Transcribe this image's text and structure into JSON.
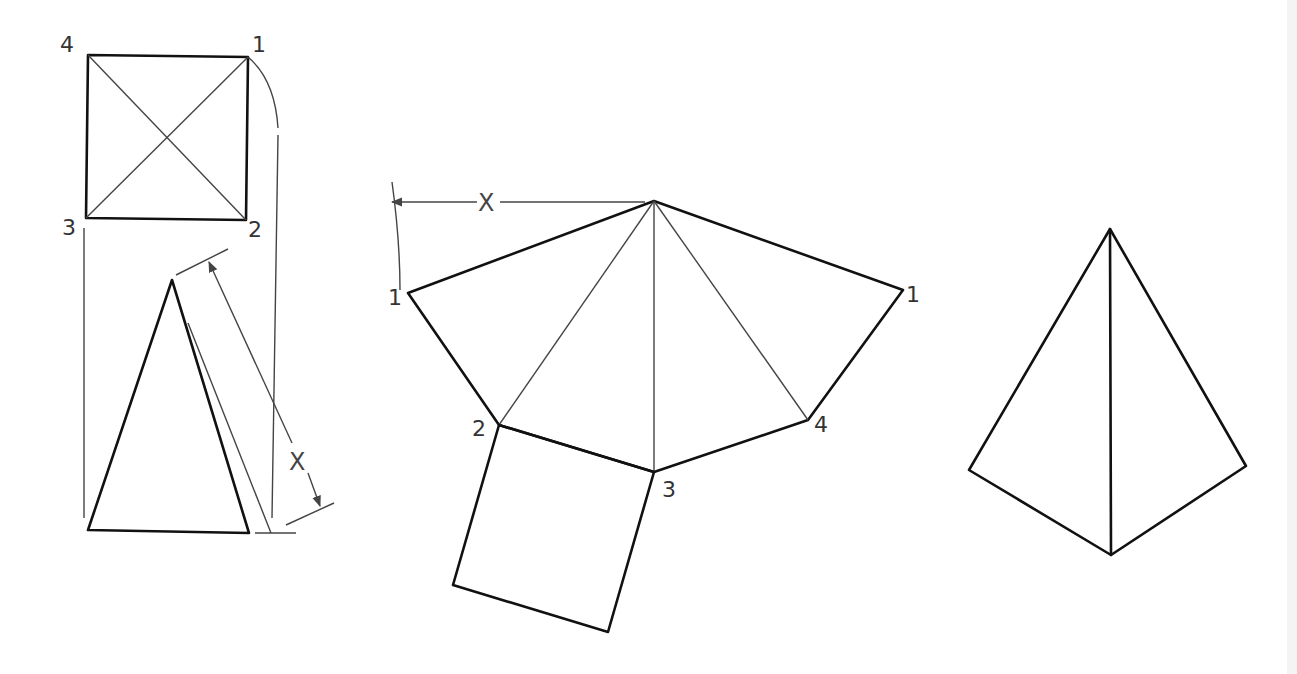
{
  "figure": {
    "colors": {
      "background": "#ffffff",
      "line": "#111111",
      "construction": "#444444",
      "label": "#333333"
    }
  },
  "top_view": {
    "labels": {
      "v4": "4",
      "v1": "1",
      "v3": "3",
      "v2": "2"
    }
  },
  "front_view": {
    "dimension_label": "X"
  },
  "pattern": {
    "radius_label": "X",
    "labels": {
      "left_1": "1",
      "right_1": "1",
      "v2": "2",
      "v3": "3",
      "v4": "4"
    }
  },
  "assembled": {
    "labels": {}
  }
}
